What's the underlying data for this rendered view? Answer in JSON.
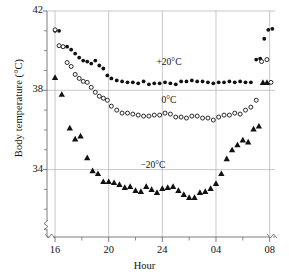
{
  "figure": {
    "title": "",
    "background_color": "#ffffff",
    "width": 289,
    "height": 277
  },
  "axis": {
    "ylabel": "Body temperature (°C)",
    "xlabel": "Hour",
    "y_tick_labels": [
      "42",
      "38",
      "34"
    ],
    "x_tick_labels": [
      "16",
      "20",
      "24",
      "04",
      "08"
    ],
    "y_axis_break": true,
    "x_axis_break": true,
    "grid": "major-xy"
  },
  "series_labels": {
    "warm": "+20°C",
    "mid": "0°C",
    "cold": "−20°C"
  },
  "colors": {
    "marker": "#111111",
    "grid": "#b9b9b9",
    "axis": "#6e6e6e",
    "text": "#111111"
  },
  "chart_data": {
    "type": "scatter",
    "title": "",
    "xlabel": "Hour",
    "ylabel": "Body temperature (°C)",
    "xlim": [
      15.4,
      32.4
    ],
    "ylim": [
      30.6,
      42.0
    ],
    "x_major_ticks": [
      16,
      20,
      24,
      28,
      32
    ],
    "x_major_tick_labels": [
      "16",
      "20",
      "24",
      "04",
      "08"
    ],
    "x_minor_ticks": [
      18,
      22,
      26,
      30
    ],
    "y_major_ticks": [
      42,
      38,
      34
    ],
    "y_minor_ticks": [
      41,
      40,
      39,
      37,
      36,
      35,
      33,
      32,
      31
    ],
    "grid": true,
    "legend_position": "inline-annotations",
    "series": [
      {
        "name": "+20°C",
        "marker": "filled-circle",
        "label": "+20°C",
        "label_x": 24.2,
        "label_y": 39.35,
        "x": [
          16.0,
          16.3,
          16.6,
          16.9,
          17.2,
          17.5,
          17.8,
          18.1,
          18.4,
          18.7,
          19.0,
          19.3,
          19.6,
          19.9,
          20.2,
          20.6,
          21.0,
          21.4,
          21.8,
          22.2,
          22.6,
          23.0,
          23.4,
          23.8,
          24.2,
          24.6,
          25.0,
          25.4,
          25.8,
          26.2,
          26.6,
          27.0,
          27.4,
          27.8,
          28.2,
          28.6,
          29.0,
          29.4,
          29.8,
          30.2,
          30.6,
          31.0,
          31.3,
          31.6,
          31.9,
          32.2
        ],
        "y": [
          41.0,
          41.0,
          40.2,
          40.2,
          40.05,
          39.85,
          39.65,
          39.5,
          39.45,
          39.35,
          39.5,
          39.25,
          39.1,
          38.75,
          38.6,
          38.5,
          38.45,
          38.4,
          38.4,
          38.35,
          38.45,
          38.3,
          38.35,
          38.35,
          38.4,
          38.35,
          38.3,
          38.45,
          38.45,
          38.5,
          38.45,
          38.45,
          38.4,
          38.35,
          38.4,
          38.4,
          38.45,
          38.4,
          38.45,
          38.4,
          38.4,
          39.55,
          39.6,
          40.6,
          41.05,
          41.1
        ]
      },
      {
        "name": "0°C",
        "marker": "open-circle",
        "label": "0°C",
        "label_x": 24.2,
        "label_y": 37.4,
        "x": [
          16.0,
          16.3,
          16.6,
          16.9,
          17.2,
          17.5,
          17.8,
          18.1,
          18.4,
          18.7,
          19.0,
          19.3,
          19.6,
          19.9,
          20.2,
          20.6,
          21.0,
          21.4,
          21.8,
          22.2,
          22.6,
          23.0,
          23.4,
          23.8,
          24.2,
          24.6,
          25.0,
          25.4,
          25.8,
          26.2,
          26.6,
          27.0,
          27.4,
          27.8,
          28.2,
          28.6,
          29.0,
          29.4,
          29.8,
          30.2,
          30.6,
          31.0,
          31.4,
          31.8,
          32.1
        ],
        "y": [
          41.05,
          40.25,
          40.2,
          39.4,
          39.2,
          38.8,
          38.6,
          38.45,
          38.4,
          38.15,
          37.9,
          37.7,
          37.6,
          37.5,
          37.2,
          37.0,
          36.85,
          36.85,
          36.8,
          36.75,
          36.7,
          36.7,
          36.75,
          36.75,
          36.85,
          36.8,
          36.65,
          36.65,
          36.6,
          36.7,
          36.7,
          36.6,
          36.6,
          36.5,
          36.65,
          36.75,
          36.75,
          36.85,
          36.8,
          37.0,
          37.15,
          37.5,
          39.45,
          39.55,
          38.4
        ]
      },
      {
        "name": "−20°C",
        "marker": "filled-triangle",
        "label": "−20°C",
        "label_x": 23.0,
        "label_y": 34.15,
        "x": [
          16.0,
          16.5,
          17.1,
          17.5,
          17.9,
          18.4,
          18.8,
          19.2,
          19.6,
          20.0,
          20.4,
          20.8,
          21.2,
          21.6,
          22.0,
          22.4,
          22.8,
          23.2,
          23.6,
          24.0,
          24.4,
          24.8,
          25.2,
          25.6,
          26.0,
          26.4,
          26.8,
          27.2,
          27.6,
          28.0,
          28.4,
          28.8,
          29.2,
          29.6,
          30.0,
          30.4,
          30.8,
          31.2,
          31.5,
          31.8
        ],
        "y": [
          38.65,
          37.8,
          36.1,
          35.55,
          35.7,
          34.6,
          33.95,
          33.8,
          33.4,
          33.4,
          33.35,
          33.25,
          33.1,
          33.15,
          32.95,
          32.9,
          33.15,
          33.0,
          32.85,
          33.05,
          33.1,
          33.15,
          32.95,
          32.75,
          32.6,
          32.6,
          32.85,
          32.9,
          33.05,
          33.3,
          33.8,
          34.55,
          35.0,
          35.25,
          35.5,
          35.4,
          36.05,
          36.2,
          38.4,
          38.4
        ]
      }
    ]
  }
}
